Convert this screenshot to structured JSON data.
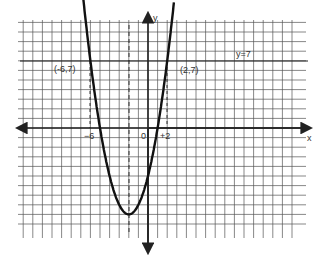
{
  "chart_data": {
    "type": "line",
    "title": "",
    "xlabel": "x",
    "ylabel": "y",
    "grid": true,
    "xlim": [
      -13,
      15
    ],
    "ylim": [
      -11,
      11
    ],
    "series": [
      {
        "name": "parabola y = x^2 + 4x - 5",
        "style": "solid-thick",
        "points": [
          [
            -7.3,
            16.8
          ],
          [
            -6,
            7
          ],
          [
            -5,
            0
          ],
          [
            -4,
            -5
          ],
          [
            -3,
            -8
          ],
          [
            -2,
            -9
          ],
          [
            -1,
            -8
          ],
          [
            0,
            -5
          ],
          [
            1,
            0
          ],
          [
            2,
            7
          ],
          [
            2.7,
            12.1
          ]
        ]
      },
      {
        "name": "y = 7",
        "style": "solid",
        "x": [
          -13,
          15
        ],
        "y": [
          7,
          7
        ]
      }
    ],
    "guides": [
      {
        "type": "vertical-dashed",
        "x": -6,
        "from_y": 0,
        "to_y": 7
      },
      {
        "type": "vertical-dashed",
        "x": 2,
        "from_y": 0,
        "to_y": 7
      },
      {
        "type": "vertical-dashed",
        "x": -2,
        "note": "axis of symmetry"
      }
    ],
    "annotations": [
      {
        "text": "(-6,7)",
        "x": -6,
        "y": 7
      },
      {
        "text": "(2,7)",
        "x": 2,
        "y": 7
      },
      {
        "text": "y = 7",
        "x": 9,
        "y": 7
      }
    ],
    "tick_labels": [
      "-6",
      "0",
      "+2"
    ]
  },
  "labels": {
    "x_axis": "x",
    "y_axis": "y",
    "pt_left": "(-6,7)",
    "pt_right": "(2,7)",
    "line_label": "y=7",
    "tick_neg6": "−6",
    "tick_0": "0",
    "tick_pos2": "+2"
  }
}
